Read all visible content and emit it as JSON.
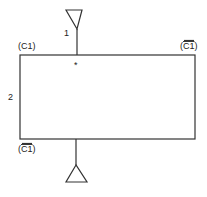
{
  "diagram": {
    "labels": {
      "port_top": "1",
      "port_left": "2",
      "corner_top_left": "(C1)",
      "corner_top_right_prefix": "(",
      "corner_top_right_over": "C1",
      "corner_top_right_suffix": ")",
      "corner_bottom_left_prefix": "(",
      "corner_bottom_left_over": "C1",
      "corner_bottom_left_suffix": ")",
      "marker": "*"
    }
  }
}
